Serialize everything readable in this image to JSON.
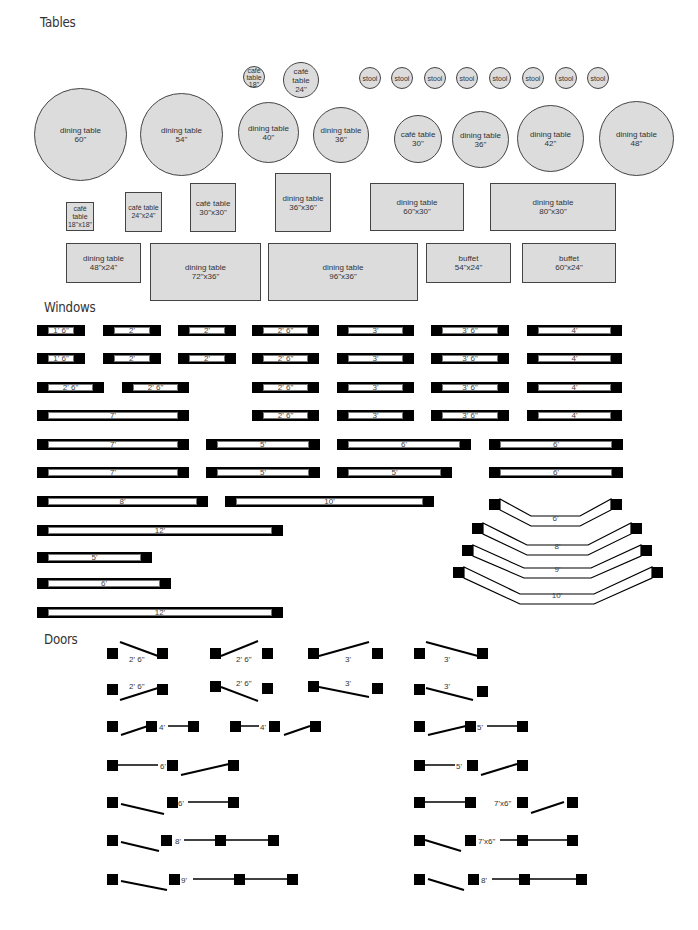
{
  "sections": {
    "tables": "Tables",
    "windows": "Windows",
    "doors": "Doors"
  },
  "tables": {
    "round": [
      {
        "label": "dining table\n60\"",
        "x": 34,
        "y": 88,
        "d": 93
      },
      {
        "label": "dining table\n54\"",
        "x": 140,
        "y": 93,
        "d": 83
      },
      {
        "label": "café\ntable\n18\"",
        "x": 243,
        "y": 66,
        "d": 22
      },
      {
        "label": "café table\n24\"",
        "x": 283,
        "y": 62,
        "d": 36
      },
      {
        "label": "dining table\n40\"",
        "x": 238,
        "y": 102,
        "d": 61
      },
      {
        "label": "dining table\n36\"",
        "x": 313,
        "y": 107,
        "d": 56
      },
      {
        "label": "café table\n30\"",
        "x": 394,
        "y": 115,
        "d": 48
      },
      {
        "label": "dining table\n36\"",
        "x": 452,
        "y": 111,
        "d": 57
      },
      {
        "label": "dining table\n42\"",
        "x": 517,
        "y": 105,
        "d": 67
      },
      {
        "label": "dining table\n48\"",
        "x": 599,
        "y": 101,
        "d": 75
      }
    ],
    "stools": [
      {
        "label": "stool",
        "x": 359,
        "y": 67
      },
      {
        "label": "stool",
        "x": 391,
        "y": 67
      },
      {
        "label": "stool",
        "x": 424,
        "y": 67
      },
      {
        "label": "stool",
        "x": 456,
        "y": 67
      },
      {
        "label": "stool",
        "x": 489,
        "y": 67
      },
      {
        "label": "stool",
        "x": 522,
        "y": 67
      },
      {
        "label": "stool",
        "x": 555,
        "y": 67
      },
      {
        "label": "stool",
        "x": 587,
        "y": 67
      }
    ],
    "rect": [
      {
        "label": "café\ntable\n18\"x18\"",
        "x": 66,
        "y": 202,
        "w": 28,
        "h": 29
      },
      {
        "label": "café table\n24\"x24\"",
        "x": 125,
        "y": 192,
        "w": 37,
        "h": 40
      },
      {
        "label": "café table\n30\"x30\"",
        "x": 190,
        "y": 183,
        "w": 46,
        "h": 49
      },
      {
        "label": "dining table\n36\"x36\"",
        "x": 275,
        "y": 173,
        "w": 56,
        "h": 59
      },
      {
        "label": "dining table\n60\"x30\"",
        "x": 370,
        "y": 183,
        "w": 94,
        "h": 48
      },
      {
        "label": "dining table\n80\"x30\"",
        "x": 490,
        "y": 183,
        "w": 126,
        "h": 48
      },
      {
        "label": "dining table\n48\"x24\"",
        "x": 66,
        "y": 243,
        "w": 75,
        "h": 40
      },
      {
        "label": "dining table\n72\"x36\"",
        "x": 150,
        "y": 243,
        "w": 111,
        "h": 58
      },
      {
        "label": "dining table\n96\"x36\"",
        "x": 268,
        "y": 243,
        "w": 150,
        "h": 58
      },
      {
        "label": "buffet\n54\"x24\"",
        "x": 426,
        "y": 243,
        "w": 85,
        "h": 40
      },
      {
        "label": "buffet\n60\"x24\"",
        "x": 522,
        "y": 243,
        "w": 94,
        "h": 40
      }
    ]
  },
  "windows": {
    "straight": [
      {
        "label": "1' 6\"",
        "x": 37,
        "y": 325,
        "w": 48
      },
      {
        "label": "2'",
        "x": 103,
        "y": 325,
        "w": 58
      },
      {
        "label": "2'",
        "x": 178,
        "y": 325,
        "w": 58
      },
      {
        "label": "2' 6\"",
        "x": 252,
        "y": 325,
        "w": 67
      },
      {
        "label": "3'",
        "x": 337,
        "y": 325,
        "w": 77
      },
      {
        "label": "3' 6\"",
        "x": 431,
        "y": 325,
        "w": 78
      },
      {
        "label": "4'",
        "x": 527,
        "y": 325,
        "w": 95
      },
      {
        "label": "1' 6\"",
        "x": 37,
        "y": 353,
        "w": 48
      },
      {
        "label": "2'",
        "x": 103,
        "y": 353,
        "w": 58
      },
      {
        "label": "2'",
        "x": 178,
        "y": 353,
        "w": 58
      },
      {
        "label": "2' 6\"",
        "x": 252,
        "y": 353,
        "w": 67
      },
      {
        "label": "3'",
        "x": 337,
        "y": 353,
        "w": 77
      },
      {
        "label": "3' 6\"",
        "x": 431,
        "y": 353,
        "w": 78
      },
      {
        "label": "4'",
        "x": 527,
        "y": 353,
        "w": 95
      },
      {
        "label": "2' 6\"",
        "x": 37,
        "y": 382,
        "w": 67
      },
      {
        "label": "2' 6\"",
        "x": 122,
        "y": 382,
        "w": 67
      },
      {
        "label": "2' 6\"",
        "x": 252,
        "y": 382,
        "w": 67
      },
      {
        "label": "3'",
        "x": 337,
        "y": 382,
        "w": 77
      },
      {
        "label": "3' 6\"",
        "x": 431,
        "y": 382,
        "w": 78
      },
      {
        "label": "4'",
        "x": 527,
        "y": 382,
        "w": 95
      },
      {
        "label": "7'",
        "x": 37,
        "y": 410,
        "w": 152
      },
      {
        "label": "2' 6\"",
        "x": 252,
        "y": 410,
        "w": 67
      },
      {
        "label": "3'",
        "x": 337,
        "y": 410,
        "w": 77
      },
      {
        "label": "3' 6\"",
        "x": 431,
        "y": 410,
        "w": 78
      },
      {
        "label": "4'",
        "x": 527,
        "y": 410,
        "w": 95
      },
      {
        "label": "7'",
        "x": 37,
        "y": 439,
        "w": 152
      },
      {
        "label": "5'",
        "x": 206,
        "y": 439,
        "w": 114
      },
      {
        "label": "6'",
        "x": 337,
        "y": 439,
        "w": 134
      },
      {
        "label": "6'",
        "x": 489,
        "y": 439,
        "w": 134
      },
      {
        "label": "7'",
        "x": 37,
        "y": 467,
        "w": 152
      },
      {
        "label": "5'",
        "x": 206,
        "y": 467,
        "w": 114
      },
      {
        "label": "5'",
        "x": 337,
        "y": 467,
        "w": 115
      },
      {
        "label": "6'",
        "x": 489,
        "y": 467,
        "w": 134
      },
      {
        "label": "8'",
        "x": 37,
        "y": 496,
        "w": 171
      },
      {
        "label": "10'",
        "x": 225,
        "y": 496,
        "w": 209
      },
      {
        "label": "12'",
        "x": 37,
        "y": 525,
        "w": 246
      },
      {
        "label": "5'",
        "x": 37,
        "y": 552,
        "w": 115
      },
      {
        "label": "6'",
        "x": 37,
        "y": 578,
        "w": 134
      },
      {
        "label": "12'",
        "x": 37,
        "y": 607,
        "w": 246
      }
    ],
    "bay": [
      {
        "label": "6'"
      },
      {
        "label": "8'"
      },
      {
        "label": "9'"
      },
      {
        "label": "10'"
      }
    ]
  },
  "doors": {
    "labels": [
      "2' 6\"",
      "2' 6\"",
      "3'",
      "3'",
      "2' 6\"",
      "2' 6\"",
      "3'",
      "3'",
      "4'",
      "4'",
      "5'",
      "6'",
      "5'",
      "6'",
      "7'x6\"",
      "8'",
      "7'x6\"",
      "9'",
      "8'"
    ]
  }
}
